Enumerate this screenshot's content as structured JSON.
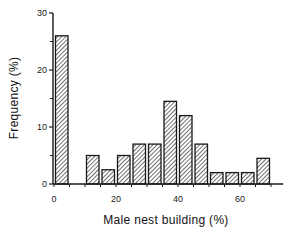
{
  "chart_data": {
    "type": "bar",
    "title": "",
    "xlabel": "Male nest building (%)",
    "ylabel": "Frequency (%)",
    "bin_width": 5,
    "bins": [
      {
        "from": 0,
        "to": 5,
        "value": 26
      },
      {
        "from": 5,
        "to": 10,
        "value": 0
      },
      {
        "from": 10,
        "to": 15,
        "value": 5
      },
      {
        "from": 15,
        "to": 20,
        "value": 2.5
      },
      {
        "from": 20,
        "to": 25,
        "value": 5
      },
      {
        "from": 25,
        "to": 30,
        "value": 7
      },
      {
        "from": 30,
        "to": 35,
        "value": 7
      },
      {
        "from": 35,
        "to": 40,
        "value": 14.5
      },
      {
        "from": 40,
        "to": 45,
        "value": 12
      },
      {
        "from": 45,
        "to": 50,
        "value": 7
      },
      {
        "from": 50,
        "to": 55,
        "value": 2
      },
      {
        "from": 55,
        "to": 60,
        "value": 2
      },
      {
        "from": 60,
        "to": 65,
        "value": 2
      },
      {
        "from": 65,
        "to": 70,
        "value": 4.5
      }
    ],
    "categories": [
      "0-5",
      "5-10",
      "10-15",
      "15-20",
      "20-25",
      "25-30",
      "30-35",
      "35-40",
      "40-45",
      "45-50",
      "50-55",
      "55-60",
      "60-65",
      "65-70"
    ],
    "values": [
      26,
      0,
      5,
      2.5,
      5,
      7,
      7,
      14.5,
      12,
      7,
      2,
      2,
      2,
      4.5
    ],
    "xlim": [
      0,
      72
    ],
    "ylim": [
      0,
      30
    ],
    "x_ticks": [
      0,
      20,
      40,
      60
    ],
    "y_ticks": [
      0,
      10,
      20,
      30
    ],
    "y_minor_ticks": [
      5,
      15,
      25
    ],
    "grid": false,
    "legend": null,
    "bar_fill": "diagonal-hatch",
    "colors": {
      "stroke": "#1a1a1a",
      "hatch": "#333333",
      "background": "#ffffff"
    }
  }
}
